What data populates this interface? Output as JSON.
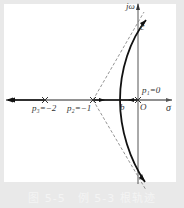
{
  "figure": {
    "caption": "图 5-5　例 5-3 根轨迹",
    "axes": {
      "imag_label": "jω",
      "real_label": "σ",
      "origin_label": "O"
    },
    "poles": [
      {
        "label": "p₁=0",
        "value": 0
      },
      {
        "label": "p₂=−1",
        "value": -1
      },
      {
        "label": "p₃=−2",
        "value": -2
      }
    ],
    "points": {
      "breakaway": "b",
      "imag_crossing": "c"
    },
    "colors": {
      "background": "#e9e9e9",
      "plot_bg": "#ffffff",
      "locus": "#111111",
      "asymptote": "#888888"
    }
  }
}
